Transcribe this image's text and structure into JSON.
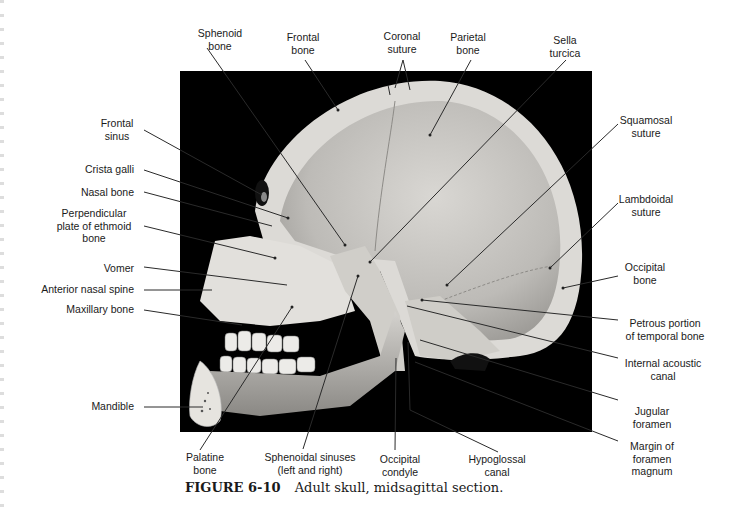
{
  "figure": {
    "number": "FIGURE 6-10",
    "caption": "Adult skull, midsagittal section."
  },
  "labels": {
    "top": [
      {
        "id": "sphenoid-bone",
        "line1": "Sphenoid",
        "line2": "bone"
      },
      {
        "id": "frontal-bone",
        "line1": "Frontal",
        "line2": "bone"
      },
      {
        "id": "coronal-suture",
        "line1": "Coronal",
        "line2": "suture"
      },
      {
        "id": "parietal-bone",
        "line1": "Parietal",
        "line2": "bone"
      },
      {
        "id": "sella-turcica",
        "line1": "Sella",
        "line2": "turcica"
      }
    ],
    "left": [
      {
        "id": "frontal-sinus",
        "line1": "Frontal",
        "line2": "sinus"
      },
      {
        "id": "crista-galli",
        "line1": "Crista galli"
      },
      {
        "id": "nasal-bone",
        "line1": "Nasal bone"
      },
      {
        "id": "perpendicular-plate",
        "line1": "Perpendicular",
        "line2": "plate of ethmoid",
        "line3": "bone"
      },
      {
        "id": "vomer",
        "line1": "Vomer"
      },
      {
        "id": "anterior-nasal-spine",
        "line1": "Anterior nasal spine"
      },
      {
        "id": "maxillary-bone",
        "line1": "Maxillary bone"
      },
      {
        "id": "mandible",
        "line1": "Mandible"
      }
    ],
    "right": [
      {
        "id": "squamosal-suture",
        "line1": "Squamosal",
        "line2": "suture"
      },
      {
        "id": "lambdoidal-suture",
        "line1": "Lambdoidal",
        "line2": "suture"
      },
      {
        "id": "occipital-bone",
        "line1": "Occipital",
        "line2": "bone"
      },
      {
        "id": "petrous-portion",
        "line1": "Petrous portion",
        "line2": "of temporal bone"
      },
      {
        "id": "internal-acoustic-canal",
        "line1": "Internal acoustic",
        "line2": "canal"
      },
      {
        "id": "jugular-foramen",
        "line1": "Jugular",
        "line2": "foramen"
      },
      {
        "id": "margin-foramen-magnum",
        "line1": "Margin of",
        "line2": "foramen",
        "line3": "magnum"
      }
    ],
    "bottom": [
      {
        "id": "palatine-bone",
        "line1": "Palatine",
        "line2": "bone"
      },
      {
        "id": "sphenoidal-sinuses",
        "line1": "Sphenoidal sinuses",
        "line2": "(left and right)"
      },
      {
        "id": "occipital-condyle",
        "line1": "Occipital",
        "line2": "condyle"
      },
      {
        "id": "hypoglossal-canal",
        "line1": "Hypoglossal",
        "line2": "canal"
      }
    ]
  },
  "colors": {
    "background": "#ffffff",
    "photo_background": "#000000",
    "bone_light": "#e8e6e2",
    "bone_mid": "#c9c7c3",
    "leader_line": "#2a2a2a"
  }
}
